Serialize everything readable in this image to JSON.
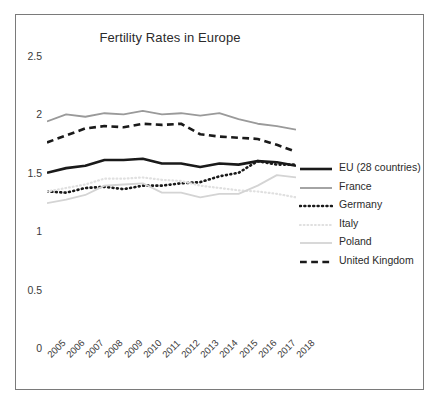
{
  "chart_data": {
    "type": "line",
    "title": "Fertility Rates in Europe",
    "xlabel": "",
    "ylabel": "",
    "x": [
      2005,
      2006,
      2007,
      2008,
      2009,
      2010,
      2011,
      2012,
      2013,
      2014,
      2015,
      2016,
      2017,
      2018
    ],
    "categories": [
      "2005",
      "2006",
      "2007",
      "2008",
      "2009",
      "2010",
      "2011",
      "2012",
      "2013",
      "2014",
      "2015",
      "2016",
      "2017",
      "2018"
    ],
    "ylim": [
      0,
      2.5
    ],
    "yticks": [
      0,
      0.5,
      1,
      1.5,
      2,
      2.5
    ],
    "ytick_labels": [
      "0",
      "0.5",
      "1",
      "1.5",
      "2",
      "2.5"
    ],
    "grid": false,
    "legend_position": "right",
    "series": [
      {
        "name": "EU (28 countries)",
        "color": "#1a1a1a",
        "style": "solid",
        "width": 2.6,
        "values": [
          1.5,
          1.54,
          1.56,
          1.61,
          1.61,
          1.62,
          1.58,
          1.58,
          1.55,
          1.58,
          1.57,
          1.6,
          1.59,
          1.56
        ]
      },
      {
        "name": "France",
        "color": "#9a9a9a",
        "style": "solid",
        "width": 1.8,
        "values": [
          1.94,
          2.0,
          1.98,
          2.01,
          2.0,
          2.03,
          2.0,
          2.01,
          1.99,
          2.01,
          1.96,
          1.92,
          1.9,
          1.87
        ]
      },
      {
        "name": "Germany",
        "color": "#1a1a1a",
        "style": "dotted",
        "width": 2.6,
        "values": [
          1.34,
          1.33,
          1.37,
          1.38,
          1.36,
          1.39,
          1.39,
          1.41,
          1.42,
          1.47,
          1.5,
          1.6,
          1.57,
          1.57
        ]
      },
      {
        "name": "Italy",
        "color": "#e0e0e0",
        "style": "dotted",
        "width": 2.2,
        "values": [
          1.34,
          1.37,
          1.4,
          1.45,
          1.45,
          1.46,
          1.44,
          1.43,
          1.39,
          1.37,
          1.35,
          1.34,
          1.32,
          1.29
        ]
      },
      {
        "name": "Poland",
        "color": "#d4d4d4",
        "style": "solid",
        "width": 1.8,
        "values": [
          1.24,
          1.27,
          1.31,
          1.39,
          1.4,
          1.41,
          1.33,
          1.33,
          1.29,
          1.32,
          1.32,
          1.39,
          1.48,
          1.46
        ]
      },
      {
        "name": "United Kingdom",
        "color": "#1a1a1a",
        "style": "dashed",
        "width": 2.6,
        "values": [
          1.76,
          1.82,
          1.88,
          1.9,
          1.89,
          1.92,
          1.91,
          1.92,
          1.83,
          1.81,
          1.8,
          1.79,
          1.74,
          1.68
        ]
      }
    ]
  },
  "axis": {
    "y_tick_labels": [
      "2.5",
      "2",
      "1.5",
      "1",
      "0.5",
      "0"
    ],
    "x_tick_labels": [
      "2005",
      "2006",
      "2007",
      "2008",
      "2009",
      "2010",
      "2011",
      "2012",
      "2013",
      "2014",
      "2015",
      "2016",
      "2017",
      "2018"
    ]
  },
  "legend": {
    "items": [
      {
        "label": "EU (28 countries)"
      },
      {
        "label": "France"
      },
      {
        "label": "Germany"
      },
      {
        "label": "Italy"
      },
      {
        "label": "Poland"
      },
      {
        "label": "United Kingdom"
      }
    ]
  }
}
